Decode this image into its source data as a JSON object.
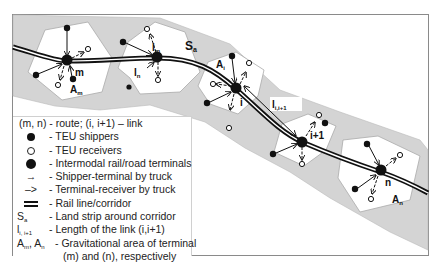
{
  "diagram": {
    "strip_label": "S",
    "strip_label_sub": "a",
    "terminals": [
      {
        "id": "m",
        "label": "m",
        "area_label": "A",
        "area_sub": "m"
      },
      {
        "id": "n1",
        "label": "",
        "link_label": "l",
        "link_sub": "m"
      },
      {
        "id": "i",
        "label": "i",
        "area_label": "A",
        "area_sub": "i"
      },
      {
        "id": "i1",
        "label": "i+1"
      },
      {
        "id": "n",
        "label": "n",
        "area_label": "A",
        "area_sub": "n"
      }
    ],
    "link_labels": {
      "l_n": {
        "main": "l",
        "sub": "n"
      },
      "l_m": {
        "main": "l",
        "sub": "m"
      },
      "l_i": {
        "main": "l",
        "sub": "i,i+1"
      }
    }
  },
  "legend": {
    "header": "(m, n) - route; (i, i+1) – link",
    "items": [
      {
        "symbol": "filled-dot",
        "text": "- TEU shippers"
      },
      {
        "symbol": "open-dot",
        "text": "- TEU receivers"
      },
      {
        "symbol": "large-dot",
        "text": "- Intermodal rail/road terminals"
      },
      {
        "symbol": "solid-arrow",
        "glyph": "→",
        "text": "- Shipper-terminal by truck"
      },
      {
        "symbol": "dashed-arrow",
        "glyph": "–>",
        "text": "- Terminal-receiver by truck"
      },
      {
        "symbol": "rail-line",
        "text": "- Rail line/corridor"
      },
      {
        "symbol": "S",
        "sub": "a",
        "text": "- Land strip around corridor"
      },
      {
        "symbol": "l",
        "sub": "i, i+1",
        "text": "- Length of the link (i,i+1)"
      },
      {
        "symbol": "A",
        "sub": "m",
        "symbol2": "A",
        "sub2": "n",
        "text": "- Gravitational area of terminal"
      },
      {
        "text": "(m) and (n), respectively"
      }
    ]
  },
  "colors": {
    "strip": "#d4d4d4",
    "area": "#ffffff",
    "area_stroke": "#aaaaaa",
    "ink": "#111111",
    "frame": "#8a8a8a"
  }
}
